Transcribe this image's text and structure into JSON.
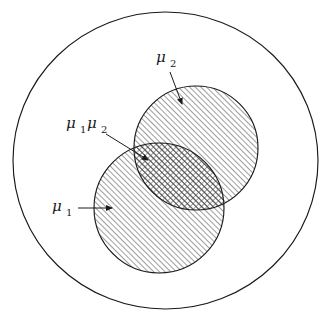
{
  "figure": {
    "type": "venn-diagram",
    "background_color": "#ffffff",
    "stroke_color": "#1a1a1a",
    "hatch_color": "#4d4d4d",
    "universe": {
      "name": "outer-boundary-ellipse",
      "cx": 165.5,
      "cy": 160.5,
      "rx": 152.5,
      "ry": 148.5,
      "fill": "none"
    },
    "sets": [
      {
        "id": "mu2",
        "label": "μ",
        "subscript": "2",
        "name": "set-circle-mu2",
        "cx": 196,
        "cy": 148,
        "r": 62,
        "hatch": "diagonal-up-right",
        "label_x": 156,
        "label_y": 62,
        "sub_x": 170,
        "sub_y": 67
      },
      {
        "id": "mu1",
        "label": "μ",
        "subscript": "1",
        "name": "set-circle-mu1",
        "cx": 159,
        "cy": 208,
        "r": 65,
        "hatch": "diagonal-up-right",
        "label_x": 52,
        "label_y": 211,
        "sub_x": 66,
        "sub_y": 216
      }
    ],
    "intersection": {
      "id": "mu1mu2",
      "name": "intersection-region",
      "label_mu_a": "μ",
      "sub_a": "1",
      "label_mu_b": "μ",
      "sub_b": "2",
      "hatch": "cross-hatch",
      "label_x": 66,
      "label_y": 128,
      "suba_x": 80,
      "suba_y": 133,
      "labelb_x": 87,
      "labelb_y": 128,
      "subb_x": 101,
      "subb_y": 133
    },
    "leaders": [
      {
        "name": "leader-arrow-mu2",
        "x1": 170,
        "y1": 72,
        "x2": 182,
        "y2": 104
      },
      {
        "name": "leader-arrow-mu1mu2",
        "x1": 106,
        "y1": 134,
        "x2": 148,
        "y2": 160
      },
      {
        "name": "leader-arrow-mu1",
        "x1": 78,
        "y1": 208,
        "x2": 112,
        "y2": 208
      }
    ]
  }
}
